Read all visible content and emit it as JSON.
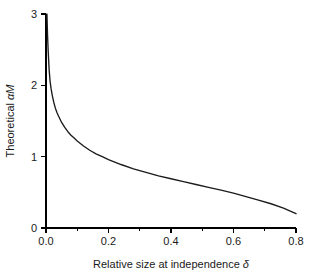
{
  "chart_data": {
    "type": "line",
    "title": "",
    "xlabel": "Relative size at independence δ",
    "ylabel": "Theoretical αM",
    "ylabel_parts": {
      "prefix": "Theoretical ",
      "symbol": "αM"
    },
    "xlabel_parts": {
      "prefix": "Relative size at independence ",
      "symbol": "δ"
    },
    "xlim": [
      0.0,
      0.8
    ],
    "ylim": [
      0.0,
      3.0
    ],
    "xticks": [
      0.0,
      0.2,
      0.4,
      0.6,
      0.8
    ],
    "xtick_labels": [
      "0.0",
      "0.2",
      "0.4",
      "0.6",
      "0.8"
    ],
    "xminor_ticks": [
      0.1,
      0.3,
      0.5,
      0.7
    ],
    "yticks": [
      0,
      1,
      2,
      3
    ],
    "ytick_labels": [
      "0",
      "1",
      "2",
      "3"
    ],
    "grid": false,
    "legend": null,
    "curve_color": "#1b1b1b",
    "series": [
      {
        "name": "Theoretical alpha-M",
        "x": [
          0.003,
          0.005,
          0.007,
          0.01,
          0.013,
          0.016,
          0.02,
          0.025,
          0.03,
          0.035,
          0.04,
          0.05,
          0.06,
          0.07,
          0.08,
          0.09,
          0.1,
          0.12,
          0.14,
          0.16,
          0.18,
          0.2,
          0.24,
          0.28,
          0.32,
          0.36,
          0.4,
          0.44,
          0.48,
          0.52,
          0.56,
          0.6,
          0.64,
          0.68,
          0.72,
          0.76,
          0.8
        ],
        "y": [
          3.0,
          2.7,
          2.48,
          2.22,
          2.06,
          1.96,
          1.86,
          1.76,
          1.68,
          1.62,
          1.57,
          1.48,
          1.41,
          1.35,
          1.3,
          1.26,
          1.22,
          1.15,
          1.09,
          1.04,
          1.0,
          0.96,
          0.89,
          0.83,
          0.78,
          0.73,
          0.69,
          0.65,
          0.61,
          0.57,
          0.53,
          0.49,
          0.44,
          0.39,
          0.34,
          0.28,
          0.2
        ]
      }
    ],
    "annotations": []
  },
  "figure": {
    "background_color": "#ffffff",
    "axis_color": "#000000"
  }
}
